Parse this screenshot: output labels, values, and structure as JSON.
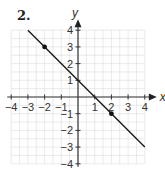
{
  "problem_label": "2.",
  "chart_data": {
    "type": "line",
    "title": "",
    "xlabel": "x",
    "ylabel": "y",
    "xlim": [
      -4,
      4
    ],
    "ylim": [
      -4,
      4
    ],
    "grid": true,
    "x_ticks": [
      -4,
      -3,
      -2,
      -1,
      1,
      2,
      3,
      4
    ],
    "y_ticks": [
      4,
      3,
      2,
      1,
      -1,
      -2,
      -3,
      -4
    ],
    "series": [
      {
        "name": "line",
        "equation": "y = -x + 1",
        "x": [
          -3,
          4
        ],
        "y": [
          4,
          -3
        ]
      }
    ],
    "points": [
      {
        "x": -2,
        "y": 3
      },
      {
        "x": 2,
        "y": -1
      }
    ]
  }
}
